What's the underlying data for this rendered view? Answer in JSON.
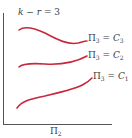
{
  "diagram": {
    "annotation": {
      "k": "k",
      "op": " − ",
      "r": "r",
      "eq": " = 3"
    },
    "x_axis_label": {
      "symbol": "Π",
      "sub": "2"
    },
    "curves": [
      {
        "name": "C3",
        "label_symbol": "Π",
        "label_sub": "3",
        "label_eq": " = ",
        "label_const": "C",
        "label_const_sub": "3"
      },
      {
        "name": "C2",
        "label_symbol": "Π",
        "label_sub": "3",
        "label_eq": " = ",
        "label_const": "C",
        "label_const_sub": "2"
      },
      {
        "name": "C1",
        "label_symbol": "Π",
        "label_sub": "3",
        "label_eq": " = ",
        "label_const": "C",
        "label_const_sub": "1"
      }
    ],
    "colors": {
      "curve": "#c8283c",
      "axis": "#555555"
    }
  }
}
